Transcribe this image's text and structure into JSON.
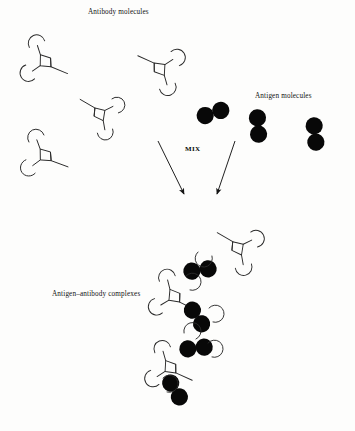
{
  "figure": {
    "background_color": "#fdfdfc",
    "ink_color": "#1a1a1a",
    "antigen_fill": "#080808",
    "width": 355,
    "height": 431
  },
  "labels": {
    "antibody": "Antibody molecules",
    "antigen": "Antigen molecules",
    "mix": "MIX",
    "complexes": "Antigen–antibody complexes"
  },
  "diagram_data": {
    "type": "schematic",
    "panels": [
      {
        "name": "free-antibodies",
        "label": "Antibody molecules",
        "count": 4,
        "items": [
          {
            "id": "antibody-1",
            "x": 47,
            "y": 62,
            "rotation": 8,
            "scale": 1.0
          },
          {
            "id": "antibody-2",
            "x": 158,
            "y": 68,
            "rotation": 190,
            "scale": 1.0
          },
          {
            "id": "antibody-3",
            "x": 98,
            "y": 113,
            "rotation": 196,
            "scale": 0.95
          },
          {
            "id": "antibody-4",
            "x": 47,
            "y": 156,
            "rotation": 6,
            "scale": 1.0
          }
        ]
      },
      {
        "name": "free-antigens",
        "label": "Antigen molecules",
        "count": 3,
        "items": [
          {
            "id": "antigen-1",
            "x": 213,
            "y": 113,
            "rotation": -18
          },
          {
            "id": "antigen-2",
            "x": 258,
            "y": 126,
            "rotation": 86
          },
          {
            "id": "antigen-3",
            "x": 315,
            "y": 134,
            "rotation": 84
          }
        ]
      },
      {
        "name": "mix-arrows",
        "label": "MIX",
        "arrows": [
          {
            "id": "arrow-left",
            "x1": 158,
            "y1": 141,
            "x2": 185,
            "y2": 196
          },
          {
            "id": "arrow-right",
            "x1": 235,
            "y1": 141,
            "x2": 216,
            "y2": 196
          }
        ]
      },
      {
        "name": "immune-complex-lattice",
        "label": "Antigen–antibody complexes",
        "antibody_count": 3,
        "antigen_count": 4,
        "items": [
          {
            "id": "complex-antibody-1",
            "x": 236,
            "y": 247,
            "rotation": 196
          },
          {
            "id": "complex-antibody-2",
            "x": 176,
            "y": 297,
            "rotation": 12
          },
          {
            "id": "complex-antibody-3",
            "x": 172,
            "y": 368,
            "rotation": 10
          },
          {
            "id": "complex-antigen-1",
            "x": 200,
            "y": 270,
            "rotation": -8
          },
          {
            "id": "complex-antigen-2",
            "x": 197,
            "y": 317,
            "rotation": 56
          },
          {
            "id": "complex-antigen-3",
            "x": 196,
            "y": 348,
            "rotation": -6
          },
          {
            "id": "complex-antigen-4",
            "x": 175,
            "y": 390,
            "rotation": 58
          }
        ]
      }
    ]
  },
  "label_positions": {
    "antibody": {
      "x": 88,
      "y": 8
    },
    "antigen": {
      "x": 255,
      "y": 92
    },
    "mix": {
      "x": 185,
      "y": 145
    },
    "complexes": {
      "x": 52,
      "y": 290
    }
  }
}
